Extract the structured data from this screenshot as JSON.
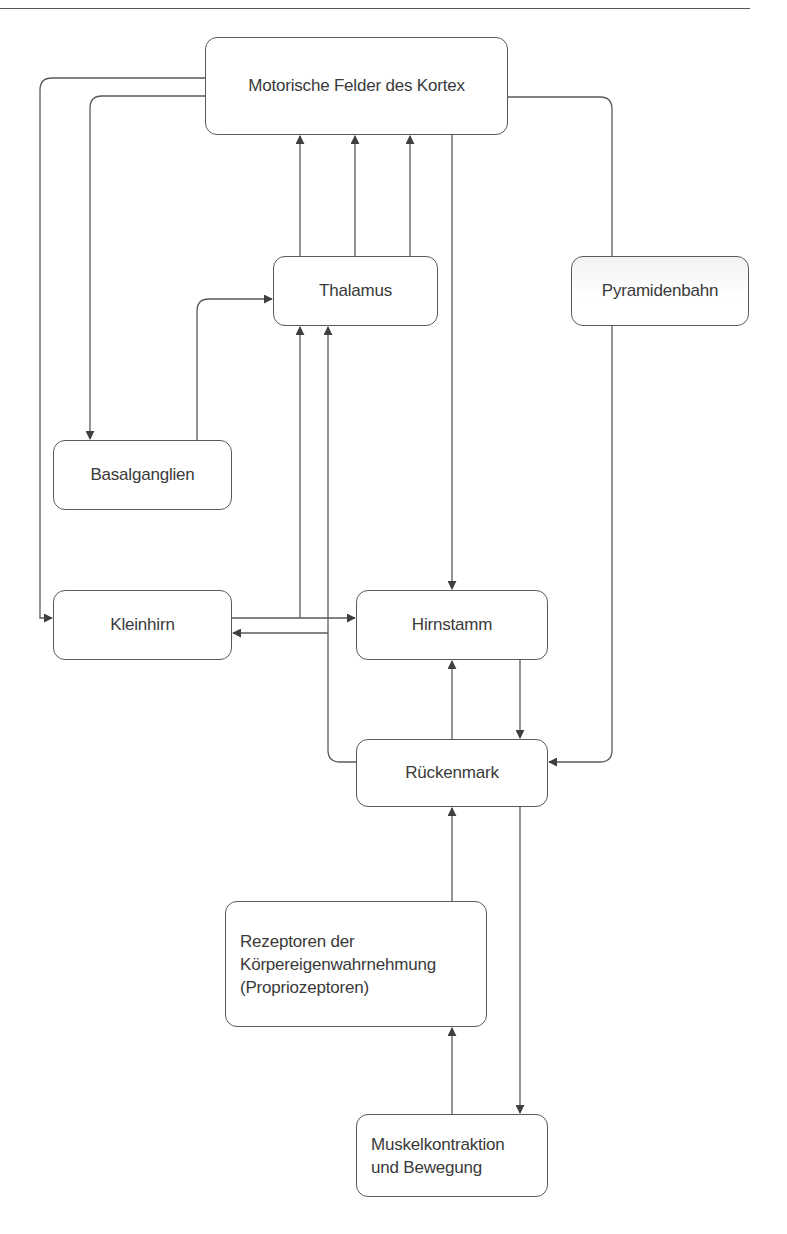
{
  "diagram": {
    "type": "flowchart",
    "topic": "Motorische Steuerung",
    "nodes": {
      "kortex": {
        "label": "Motorische Felder des Kortex"
      },
      "thalamus": {
        "label": "Thalamus"
      },
      "pyramidenbahn": {
        "label": "Pyramidenbahn"
      },
      "basalganglien": {
        "label": "Basalganglien"
      },
      "kleinhirn": {
        "label": "Kleinhirn"
      },
      "hirnstamm": {
        "label": "Hirnstamm"
      },
      "rueckenmark": {
        "label": "Rückenmark"
      },
      "rezeptoren": {
        "label": "Rezeptoren der\nKörpereigenwahrnehmung\n(Propriozeptoren)"
      },
      "muskel": {
        "label": "Muskelkontraktion\nund Bewegung"
      }
    },
    "edges": [
      {
        "from": "Motorische Felder des Kortex",
        "to": "Kleinhirn"
      },
      {
        "from": "Motorische Felder des Kortex",
        "to": "Basalganglien"
      },
      {
        "from": "Motorische Felder des Kortex",
        "to": "Hirnstamm"
      },
      {
        "from": "Motorische Felder des Kortex",
        "to": "Pyramidenbahn"
      },
      {
        "from": "Pyramidenbahn",
        "to": "Rückenmark"
      },
      {
        "from": "Thalamus",
        "to": "Motorische Felder des Kortex",
        "count": 3
      },
      {
        "from": "Basalganglien",
        "to": "Thalamus"
      },
      {
        "from": "Kleinhirn",
        "to": "Thalamus"
      },
      {
        "from": "Kleinhirn",
        "to": "Hirnstamm"
      },
      {
        "from": "Rückenmark",
        "to": "Kleinhirn"
      },
      {
        "from": "Rückenmark",
        "to": "Thalamus"
      },
      {
        "from": "Hirnstamm",
        "to": "Rückenmark"
      },
      {
        "from": "Rückenmark",
        "to": "Hirnstamm"
      },
      {
        "from": "Rückenmark",
        "to": "Muskelkontraktion und Bewegung"
      },
      {
        "from": "Rezeptoren der Körpereigenwahrnehmung (Propriozeptoren)",
        "to": "Rückenmark"
      },
      {
        "from": "Muskelkontraktion und Bewegung",
        "to": "Rezeptoren der Körpereigenwahrnehmung (Propriozeptoren)"
      }
    ]
  },
  "colors": {
    "line": "#5a5a5a",
    "text": "#3a3a3a",
    "background": "#ffffff"
  }
}
